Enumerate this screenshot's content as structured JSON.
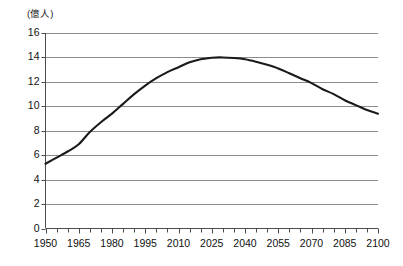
{
  "chart_data": {
    "type": "line",
    "title": "",
    "subtitle": "",
    "xlabel": "",
    "ylabel": "",
    "unit_label": "(億人)",
    "grid": true,
    "legend": false,
    "legend_position": "none",
    "xlim": [
      1950,
      2100
    ],
    "ylim": [
      0,
      16
    ],
    "x_tick_step": 15,
    "x_minor_tick_step": 5,
    "y_tick_step": 2,
    "x_tick_labels": [
      "1950",
      "1965",
      "1980",
      "1995",
      "2010",
      "2025",
      "2040",
      "2055",
      "2070",
      "2085",
      "2100"
    ],
    "y_tick_labels": [
      "0",
      "2",
      "4",
      "6",
      "8",
      "10",
      "12",
      "14",
      "16"
    ],
    "series": [
      {
        "name": "world-population",
        "color": "#1a1a1a",
        "x": [
          1950,
          1955,
          1960,
          1965,
          1970,
          1975,
          1980,
          1985,
          1990,
          1995,
          2000,
          2005,
          2010,
          2015,
          2020,
          2025,
          2030,
          2035,
          2040,
          2045,
          2050,
          2055,
          2060,
          2065,
          2070,
          2075,
          2080,
          2085,
          2090,
          2095,
          2100
        ],
        "values": [
          5.3,
          5.8,
          6.3,
          6.9,
          7.9,
          8.7,
          9.4,
          10.2,
          11.0,
          11.7,
          12.3,
          12.8,
          13.2,
          13.6,
          13.85,
          13.98,
          14.0,
          13.95,
          13.85,
          13.65,
          13.4,
          13.1,
          12.7,
          12.3,
          11.9,
          11.4,
          11.0,
          10.5,
          10.1,
          9.7,
          9.4
        ]
      }
    ]
  },
  "colors": {
    "line": "#1a1a1a",
    "grid": "#8c8c8c",
    "axis": "#4d4d4d",
    "background": "#ffffff",
    "text": "#111111"
  }
}
